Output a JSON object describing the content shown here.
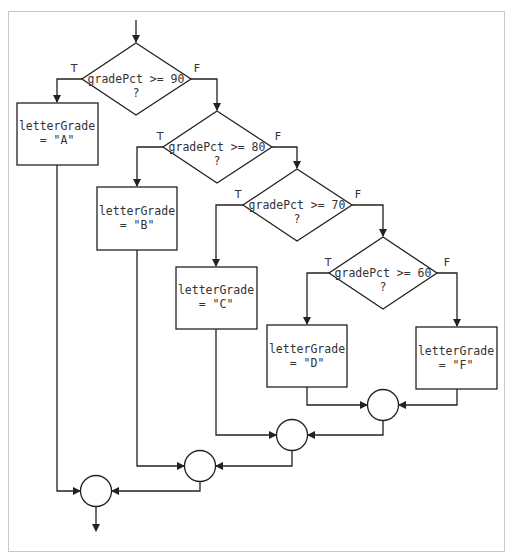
{
  "diagram": {
    "type": "flowchart",
    "decisions": [
      {
        "id": "d1",
        "line1": "gradePct >= 90",
        "line2": "?",
        "true_label": "T",
        "false_label": "F"
      },
      {
        "id": "d2",
        "line1": "gradePct >= 80",
        "line2": "?",
        "true_label": "T",
        "false_label": "F"
      },
      {
        "id": "d3",
        "line1": "gradePct >= 70",
        "line2": "?",
        "true_label": "T",
        "false_label": "F"
      },
      {
        "id": "d4",
        "line1": "gradePct >= 60",
        "line2": "?",
        "true_label": "T",
        "false_label": "F"
      }
    ],
    "processes": [
      {
        "id": "pA",
        "line1": "letterGrade",
        "line2": "= \"A\""
      },
      {
        "id": "pB",
        "line1": "letterGrade",
        "line2": "= \"B\""
      },
      {
        "id": "pC",
        "line1": "letterGrade",
        "line2": "= \"C\""
      },
      {
        "id": "pD",
        "line1": "letterGrade",
        "line2": "= \"D\""
      },
      {
        "id": "pF",
        "line1": "letterGrade",
        "line2": "= \"F\""
      }
    ],
    "connectors": [
      {
        "id": "j1",
        "joins": [
          "pD",
          "pF"
        ]
      },
      {
        "id": "j2",
        "joins": [
          "pC",
          "j1"
        ]
      },
      {
        "id": "j3",
        "joins": [
          "pB",
          "j2"
        ]
      },
      {
        "id": "j4",
        "joins": [
          "pA",
          "j3"
        ]
      }
    ],
    "colors": {
      "stroke": "#222222",
      "text": "#333333",
      "frame": "#c8c8c8",
      "background": "#ffffff"
    }
  }
}
